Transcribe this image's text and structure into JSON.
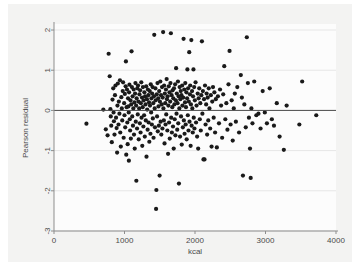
{
  "figure": {
    "background_color": "#f3f3f2",
    "plot_background_color": "#fcfcfc"
  },
  "chart_data": {
    "type": "scatter",
    "title": "",
    "subtitle": "",
    "xlabel": "kcal",
    "ylabel": "Pearson residual",
    "xlim": [
      0,
      4000
    ],
    "ylim": [
      -3,
      2.15
    ],
    "xticks": [
      0,
      1000,
      2000,
      3000,
      4000
    ],
    "xticklabels": [
      "0",
      "1000",
      "2000",
      "3000",
      "4000"
    ],
    "yticks": [
      2,
      1,
      0,
      -1,
      -2,
      -3
    ],
    "yticklabels": [
      "2",
      "1",
      "0",
      "-1",
      "-2",
      "-3"
    ],
    "grid": "horizontal",
    "legend": "none",
    "reference_lines": [
      {
        "orientation": "horizontal",
        "y": 0,
        "color": "#4d4d4d"
      }
    ],
    "marker": {
      "shape": "circle",
      "color": "#1a1a1a",
      "size": 3.1
    },
    "n_points": 306,
    "annotations": [],
    "points": [
      [
        460,
        -0.33
      ],
      [
        700,
        0.02
      ],
      [
        735,
        -0.47
      ],
      [
        760,
        -0.62
      ],
      [
        775,
        1.41
      ],
      [
        790,
        0.85
      ],
      [
        800,
        0.03
      ],
      [
        805,
        -0.15
      ],
      [
        812,
        -0.38
      ],
      [
        820,
        -0.79
      ],
      [
        830,
        0.27
      ],
      [
        840,
        0.55
      ],
      [
        845,
        -0.05
      ],
      [
        850,
        -0.27
      ],
      [
        858,
        -0.6
      ],
      [
        865,
        0.38
      ],
      [
        872,
        0.62
      ],
      [
        880,
        -0.18
      ],
      [
        888,
        -0.44
      ],
      [
        895,
        -1.05
      ],
      [
        900,
        0.12
      ],
      [
        905,
        0.67
      ],
      [
        915,
        -0.35
      ],
      [
        920,
        0.22
      ],
      [
        928,
        -0.08
      ],
      [
        935,
        0.75
      ],
      [
        940,
        -0.55
      ],
      [
        948,
        -0.9
      ],
      [
        955,
        0.33
      ],
      [
        962,
        0.05
      ],
      [
        968,
        -0.25
      ],
      [
        975,
        0.48
      ],
      [
        980,
        0.7
      ],
      [
        988,
        -0.68
      ],
      [
        995,
        0.18
      ],
      [
        1000,
        -0.12
      ],
      [
        1005,
        0.41
      ],
      [
        1010,
        -0.42
      ],
      [
        1016,
        0.6
      ],
      [
        1020,
        1.22
      ],
      [
        1025,
        -1.1
      ],
      [
        1030,
        0.08
      ],
      [
        1035,
        0.52
      ],
      [
        1040,
        -0.3
      ],
      [
        1045,
        -0.84
      ],
      [
        1050,
        0.3
      ],
      [
        1055,
        0.1
      ],
      [
        1060,
        -0.05
      ],
      [
        1062,
        -1.25
      ],
      [
        1065,
        0.45
      ],
      [
        1070,
        0.64
      ],
      [
        1075,
        -0.22
      ],
      [
        1080,
        -0.5
      ],
      [
        1085,
        0.25
      ],
      [
        1090,
        -0.7
      ],
      [
        1095,
        0.15
      ],
      [
        1100,
        1.47
      ],
      [
        1105,
        0.58
      ],
      [
        1110,
        -0.15
      ],
      [
        1115,
        0.35
      ],
      [
        1120,
        -0.38
      ],
      [
        1125,
        0.05
      ],
      [
        1130,
        0.52
      ],
      [
        1135,
        -0.6
      ],
      [
        1140,
        0.2
      ],
      [
        1145,
        -0.95
      ],
      [
        1150,
        0.42
      ],
      [
        1155,
        0.68
      ],
      [
        1160,
        -0.28
      ],
      [
        1165,
        0.12
      ],
      [
        1168,
        -1.75
      ],
      [
        1172,
        0.3
      ],
      [
        1178,
        -0.45
      ],
      [
        1182,
        0.55
      ],
      [
        1188,
        -0.1
      ],
      [
        1192,
        0.62
      ],
      [
        1198,
        0.22
      ],
      [
        1202,
        -0.72
      ],
      [
        1208,
        0.05
      ],
      [
        1212,
        0.4
      ],
      [
        1218,
        -0.32
      ],
      [
        1222,
        0.5
      ],
      [
        1228,
        -0.55
      ],
      [
        1232,
        0.18
      ],
      [
        1238,
        0.7
      ],
      [
        1242,
        -0.18
      ],
      [
        1248,
        0.32
      ],
      [
        1252,
        -0.88
      ],
      [
        1258,
        0.08
      ],
      [
        1262,
        0.58
      ],
      [
        1268,
        -0.4
      ],
      [
        1272,
        0.25
      ],
      [
        1278,
        -0.12
      ],
      [
        1282,
        0.45
      ],
      [
        1288,
        -0.65
      ],
      [
        1292,
        0.35
      ],
      [
        1298,
        0.15
      ],
      [
        1302,
        -0.25
      ],
      [
        1308,
        0.6
      ],
      [
        1312,
        -1.15
      ],
      [
        1318,
        0.28
      ],
      [
        1322,
        0.02
      ],
      [
        1328,
        -0.48
      ],
      [
        1332,
        0.52
      ],
      [
        1338,
        0.38
      ],
      [
        1342,
        -0.3
      ],
      [
        1348,
        0.2
      ],
      [
        1352,
        -0.78
      ],
      [
        1358,
        0.48
      ],
      [
        1362,
        0.12
      ],
      [
        1368,
        -0.58
      ],
      [
        1372,
        0.65
      ],
      [
        1378,
        -0.05
      ],
      [
        1382,
        0.3
      ],
      [
        1388,
        -0.35
      ],
      [
        1392,
        0.42
      ],
      [
        1398,
        0.58
      ],
      [
        1402,
        -0.2
      ],
      [
        1408,
        0.18
      ],
      [
        1412,
        -0.68
      ],
      [
        1418,
        0.35
      ],
      [
        1422,
        1.88
      ],
      [
        1428,
        0.05
      ],
      [
        1432,
        -0.42
      ],
      [
        1438,
        0.55
      ],
      [
        1442,
        0.25
      ],
      [
        1448,
        -2.45
      ],
      [
        1452,
        -1.98
      ],
      [
        1458,
        0.4
      ],
      [
        1462,
        -0.15
      ],
      [
        1468,
        0.68
      ],
      [
        1472,
        -0.52
      ],
      [
        1478,
        0.3
      ],
      [
        1482,
        0.1
      ],
      [
        1488,
        -0.38
      ],
      [
        1492,
        0.48
      ],
      [
        1498,
        -1.62
      ],
      [
        1502,
        0.22
      ],
      [
        1508,
        0.72
      ],
      [
        1512,
        -0.28
      ],
      [
        1518,
        0.38
      ],
      [
        1522,
        -0.6
      ],
      [
        1528,
        0.15
      ],
      [
        1532,
        0.58
      ],
      [
        1538,
        -0.45
      ],
      [
        1542,
        0.32
      ],
      [
        1548,
        1.95
      ],
      [
        1552,
        0.05
      ],
      [
        1558,
        -0.25
      ],
      [
        1562,
        0.62
      ],
      [
        1568,
        -0.82
      ],
      [
        1572,
        0.42
      ],
      [
        1578,
        0.18
      ],
      [
        1582,
        -0.35
      ],
      [
        1588,
        0.52
      ],
      [
        1592,
        -0.1
      ],
      [
        1598,
        0.78
      ],
      [
        1602,
        0.28
      ],
      [
        1608,
        -0.5
      ],
      [
        1612,
        0.35
      ],
      [
        1618,
        -1.08
      ],
      [
        1622,
        0.12
      ],
      [
        1628,
        0.6
      ],
      [
        1632,
        -0.3
      ],
      [
        1638,
        0.45
      ],
      [
        1642,
        -0.7
      ],
      [
        1648,
        0.22
      ],
      [
        1652,
        0.68
      ],
      [
        1658,
        1.92
      ],
      [
        1662,
        -0.18
      ],
      [
        1668,
        0.38
      ],
      [
        1672,
        -0.55
      ],
      [
        1678,
        0.08
      ],
      [
        1682,
        0.5
      ],
      [
        1688,
        -0.4
      ],
      [
        1692,
        0.3
      ],
      [
        1698,
        -0.95
      ],
      [
        1702,
        0.55
      ],
      [
        1708,
        0.15
      ],
      [
        1712,
        -0.22
      ],
      [
        1718,
        0.65
      ],
      [
        1722,
        -0.62
      ],
      [
        1728,
        0.25
      ],
      [
        1732,
        1.05
      ],
      [
        1738,
        -0.08
      ],
      [
        1742,
        0.42
      ],
      [
        1748,
        -0.48
      ],
      [
        1752,
        0.18
      ],
      [
        1758,
        0.72
      ],
      [
        1762,
        -0.32
      ],
      [
        1768,
        0.35
      ],
      [
        1772,
        -1.82
      ],
      [
        1778,
        0.05
      ],
      [
        1782,
        0.58
      ],
      [
        1788,
        -0.65
      ],
      [
        1792,
        0.28
      ],
      [
        1798,
        0.48
      ],
      [
        1802,
        -0.15
      ],
      [
        1808,
        0.38
      ],
      [
        1812,
        -0.85
      ],
      [
        1818,
        0.62
      ],
      [
        1822,
        0.12
      ],
      [
        1828,
        -0.42
      ],
      [
        1832,
        0.32
      ],
      [
        1838,
        1.78
      ],
      [
        1842,
        -0.25
      ],
      [
        1848,
        0.52
      ],
      [
        1852,
        -0.58
      ],
      [
        1858,
        0.2
      ],
      [
        1862,
        0.68
      ],
      [
        1868,
        -0.35
      ],
      [
        1872,
        0.08
      ],
      [
        1878,
        0.45
      ],
      [
        1882,
        -0.72
      ],
      [
        1888,
        0.3
      ],
      [
        1892,
        1.02
      ],
      [
        1898,
        -0.12
      ],
      [
        1902,
        0.55
      ],
      [
        1908,
        -0.5
      ],
      [
        1912,
        0.22
      ],
      [
        1918,
        1.45
      ],
      [
        1922,
        -0.28
      ],
      [
        1928,
        0.4
      ],
      [
        1932,
        0.62
      ],
      [
        1938,
        -0.88
      ],
      [
        1942,
        0.15
      ],
      [
        1948,
        1.75
      ],
      [
        1952,
        -0.38
      ],
      [
        1958,
        0.48
      ],
      [
        1962,
        0.05
      ],
      [
        1968,
        -0.55
      ],
      [
        1972,
        0.35
      ],
      [
        1978,
        1.02
      ],
      [
        1982,
        -0.18
      ],
      [
        1988,
        0.58
      ],
      [
        1992,
        -0.45
      ],
      [
        1998,
        0.25
      ],
      [
        2008,
        0.7
      ],
      [
        2015,
        -0.3
      ],
      [
        2022,
        0.12
      ],
      [
        2030,
        -0.65
      ],
      [
        2038,
        0.42
      ],
      [
        2045,
        -0.95
      ],
      [
        2052,
        0.3
      ],
      [
        2060,
        0.55
      ],
      [
        2068,
        -0.22
      ],
      [
        2075,
        0.18
      ],
      [
        2082,
        -0.5
      ],
      [
        2090,
        0.38
      ],
      [
        2098,
        1.72
      ],
      [
        2105,
        -0.08
      ],
      [
        2112,
        0.48
      ],
      [
        2120,
        -1.22
      ],
      [
        2128,
        0.28
      ],
      [
        2135,
        -1.22
      ],
      [
        2142,
        0.62
      ],
      [
        2150,
        -0.35
      ],
      [
        2158,
        0.15
      ],
      [
        2165,
        0.42
      ],
      [
        2172,
        -0.6
      ],
      [
        2180,
        0.32
      ],
      [
        2188,
        -0.25
      ],
      [
        2195,
        0.55
      ],
      [
        2205,
        0.05
      ],
      [
        2215,
        -0.45
      ],
      [
        2225,
        0.38
      ],
      [
        2235,
        -0.9
      ],
      [
        2245,
        0.22
      ],
      [
        2255,
        0.58
      ],
      [
        2265,
        -0.18
      ],
      [
        2275,
        0.45
      ],
      [
        2285,
        -0.55
      ],
      [
        2295,
        0.28
      ],
      [
        2310,
        -0.92
      ],
      [
        2325,
        0.35
      ],
      [
        2340,
        -0.32
      ],
      [
        2355,
        0.52
      ],
      [
        2370,
        0.12
      ],
      [
        2385,
        -0.68
      ],
      [
        2400,
        0.4
      ],
      [
        2415,
        1.1
      ],
      [
        2430,
        -0.22
      ],
      [
        2445,
        0.18
      ],
      [
        2460,
        -0.48
      ],
      [
        2475,
        0.65
      ],
      [
        2490,
        1.48
      ],
      [
        2505,
        -0.35
      ],
      [
        2520,
        0.25
      ],
      [
        2535,
        -0.75
      ],
      [
        2550,
        0.05
      ],
      [
        2565,
        0.42
      ],
      [
        2580,
        -0.28
      ],
      [
        2600,
        0.58
      ],
      [
        2625,
        -0.55
      ],
      [
        2650,
        0.88
      ],
      [
        2665,
        0.32
      ],
      [
        2680,
        -1.62
      ],
      [
        2700,
        0.15
      ],
      [
        2720,
        -0.42
      ],
      [
        2735,
        1.82
      ],
      [
        2750,
        0.68
      ],
      [
        2765,
        -0.18
      ],
      [
        2780,
        -0.95
      ],
      [
        2790,
        -1.68
      ],
      [
        2800,
        0.05
      ],
      [
        2815,
        -0.32
      ],
      [
        2840,
        0.72
      ],
      [
        2870,
        -0.12
      ],
      [
        2900,
        -0.08
      ],
      [
        2930,
        -0.45
      ],
      [
        2960,
        0.48
      ],
      [
        2990,
        -0.05
      ],
      [
        3020,
        -0.32
      ],
      [
        3060,
        0.55
      ],
      [
        3090,
        -0.22
      ],
      [
        3120,
        -0.38
      ],
      [
        3160,
        0.18
      ],
      [
        3200,
        -0.65
      ],
      [
        3260,
        -0.98
      ],
      [
        3300,
        0.12
      ],
      [
        3480,
        -0.35
      ],
      [
        3520,
        0.72
      ],
      [
        3720,
        -0.12
      ]
    ]
  }
}
